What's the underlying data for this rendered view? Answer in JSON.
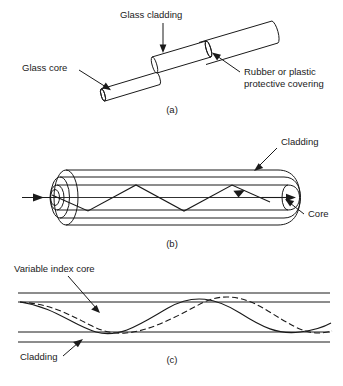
{
  "figure": {
    "accent_color": "#1a1a1a",
    "background_color": "#ffffff"
  },
  "panels": [
    {
      "id": "a",
      "caption": "(a)",
      "description": "Cutaway perspective view of a stepped optical fiber cable showing three concentric layers",
      "labels": [
        {
          "name": "glass-cladding",
          "text": "Glass cladding"
        },
        {
          "name": "glass-core",
          "text": "Glass core"
        },
        {
          "name": "protective-covering-line1",
          "text": "Rubber or plastic"
        },
        {
          "name": "protective-covering-line2",
          "text": "protective covering"
        }
      ]
    },
    {
      "id": "b",
      "caption": "(b)",
      "description": "Longitudinal section of a step-index fiber with a zig-zag totally internally reflected ray",
      "labels": [
        {
          "name": "cladding",
          "text": "Cladding"
        },
        {
          "name": "core",
          "text": "Core"
        }
      ]
    },
    {
      "id": "c",
      "caption": "(c)",
      "description": "Graded-index fiber section with two sinusoidal refracted ray paths",
      "labels": [
        {
          "name": "variable-index-core",
          "text": "Variable index core"
        },
        {
          "name": "cladding",
          "text": "Cladding"
        }
      ]
    }
  ]
}
